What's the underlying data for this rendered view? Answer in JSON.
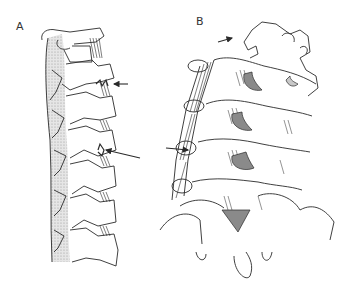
{
  "figure": {
    "panels": [
      {
        "id": "A",
        "label": "A",
        "view": "lateral view of cervical spine",
        "arrows": [
          {
            "target": "upper facet joint osteophyte",
            "direction": "left"
          },
          {
            "target": "lower facet joint",
            "direction": "left"
          }
        ]
      },
      {
        "id": "B",
        "label": "B",
        "view": "posterior oblique view of cervical spine",
        "arrows": [
          {
            "target": "upper articular process",
            "direction": "right"
          },
          {
            "target": "facet joint",
            "direction": "right"
          }
        ]
      }
    ],
    "colors": {
      "line": "#2a2a2a",
      "shade": "#c8c8c8",
      "dark_shade": "#8a8a8a",
      "background": "#ffffff"
    }
  }
}
